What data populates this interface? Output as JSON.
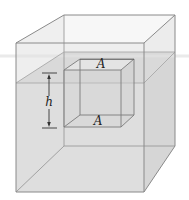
{
  "figure": {
    "labels": {
      "top_face_area": "A",
      "bottom_face_area": "A",
      "height": "h"
    },
    "colors": {
      "tank_edge": "#8a8a8a",
      "tank_air": "#f1f1f1",
      "fluid": "#dcdcdc",
      "fluid_surface": "#cfcfcf",
      "cube_edge": "#777777",
      "dimension_line": "#333333",
      "label_text": "#222222"
    }
  }
}
